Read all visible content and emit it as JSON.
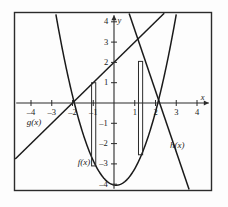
{
  "chart_data": {
    "type": "line",
    "title": "",
    "xlabel": "x",
    "ylabel": "y",
    "xlim": [
      -4.8,
      5.1
    ],
    "ylim": [
      -4.5,
      4.6
    ],
    "grid": false,
    "legend": "inline-curve-labels",
    "xticks": [
      -4,
      -3,
      -2,
      -1,
      1,
      2,
      3,
      4
    ],
    "yticks": [
      -4,
      -3,
      -2,
      -1,
      1,
      2,
      3,
      4
    ],
    "xtick_labels": [
      "–4",
      "–3",
      "–2",
      "–1",
      "1",
      "2",
      "3",
      "4"
    ],
    "ytick_labels": [
      "–4",
      "–3",
      "–2",
      "–1",
      "1",
      "2",
      "3",
      "4"
    ],
    "series": [
      {
        "name": "f(x)",
        "label": "f(x)",
        "kind": "parabola",
        "equation": "f(x) = x^2 - 4",
        "a": 1.0,
        "h": 0.1,
        "k": -4.05,
        "color": "#1a1a1a",
        "label_x": -1.75,
        "label_y": -2.95
      },
      {
        "name": "g(x)",
        "label": "g(x)",
        "kind": "line",
        "equation": "g(x) = x + 2",
        "slope": 1.0,
        "intercept": 2.0,
        "color": "#1a1a1a",
        "label_x": -4.2,
        "label_y": -1.0
      },
      {
        "name": "h(x)",
        "label": "h(x)",
        "kind": "line",
        "equation": "h(x) = -3x + 6.6",
        "slope": -3.0,
        "intercept": 6.6,
        "color": "#1a1a1a",
        "label_x": 2.7,
        "label_y": -2.1
      }
    ],
    "rectangles": [
      {
        "name": "bar-left",
        "x_left": -1.08,
        "x_right": -0.88,
        "y_top": 1.0,
        "y_bottom": -3.1
      },
      {
        "name": "bar-right",
        "x_left": 1.18,
        "x_right": 1.38,
        "y_top": 2.05,
        "y_bottom": -2.55
      }
    ],
    "annotations": []
  },
  "axes": {
    "x_axis_label": "x",
    "y_axis_label": "y"
  }
}
